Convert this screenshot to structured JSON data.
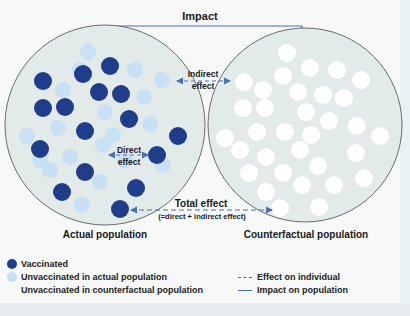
{
  "colors": {
    "vaccinated": "#1f3d8a",
    "unvaccinated_actual": "#c8e0f4",
    "unvaccinated_counterfactual": "#ffffff",
    "population_fill": "#e3eaea",
    "outline": "#6b6b6b",
    "arrow": "#4a6fb5"
  },
  "diagram": {
    "impact_label": "Impact",
    "indirect_effect_label_line1": "Indirect",
    "indirect_effect_label_line2": "effect",
    "direct_effect_label_line1": "Direct",
    "direct_effect_label_line2": "effect",
    "total_effect_label": "Total effect",
    "total_effect_sublabel": "(=direct + indirect effect)",
    "actual_population_label": "Actual population",
    "counterfactual_population_label": "Counterfactual population"
  },
  "legend": {
    "vaccinated": "Vaccinated",
    "unvaccinated_actual": "Unvaccinated in actual population",
    "unvaccinated_counterfactual": "Unvaccinated in counterfactual population",
    "effect_on_individual": "Effect on individual",
    "impact_on_population": "Impact on population"
  }
}
